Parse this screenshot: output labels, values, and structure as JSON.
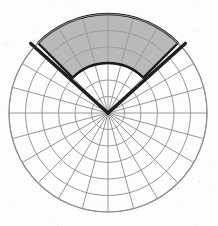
{
  "figure": {
    "background_color": "#fdfdfd",
    "width": 218,
    "height": 226
  },
  "polar_grid": {
    "center_x": 108,
    "center_y": 113,
    "outer_radius": 99,
    "ring_count": 6,
    "ring_radii": [
      16.5,
      33,
      49.5,
      66,
      82.5,
      99
    ],
    "spoke_count": 24,
    "spoke_step_degrees": 15,
    "grid_color": "#8c8c8c",
    "grid_line_width": 0.9,
    "outer_circle_color": "#8a8a8a",
    "outer_circle_width": 1.1
  },
  "shaded_sector": {
    "label": "shaded-annular-sector",
    "fill_color": "#9e9e9e",
    "fill_opacity": 0.72,
    "edge_color": "#1a1a1a",
    "edge_width": 2.4,
    "start_angle_degrees": 135,
    "end_angle_degrees": 45,
    "inner_radius": 50,
    "outer_radius": 99
  },
  "radial_arms": [
    {
      "label": "left-arm",
      "angle_degrees": 138,
      "inner_radius": 0,
      "outer_radius": 104,
      "color": "#1f1f1f",
      "line_width": 3.4,
      "tip_x": 32,
      "tip_y": 42
    },
    {
      "label": "right-arm",
      "angle_degrees": 42,
      "inner_radius": 0,
      "outer_radius": 104,
      "color": "#1f1f1f",
      "line_width": 3.4,
      "tip_x": 188,
      "tip_y": 42
    }
  ],
  "chart_data": {
    "type": "pie",
    "xlabel": "",
    "ylabel": "",
    "categories": [
      "shaded sector",
      "unshaded remainder"
    ],
    "values": [
      90,
      270
    ],
    "units": "degrees",
    "grid": true,
    "legend": "none",
    "axis_ranges": {
      "theta": [
        0,
        360
      ],
      "r": [
        0,
        99
      ]
    },
    "annotations": [
      "shaded annular sector from 45° to 135°",
      "inner radius 50, outer radius 99",
      "two bold radial arms at 42° and 138°"
    ]
  }
}
